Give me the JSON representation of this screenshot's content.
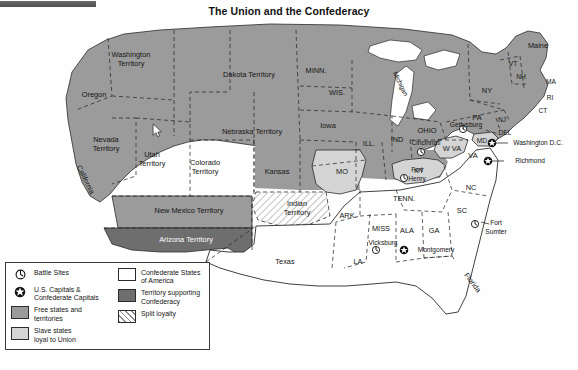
{
  "title": "The Union and the Confederacy",
  "colors": {
    "free_states": "#9b9b9b",
    "slave_loyal": "#d4d4d4",
    "confederate": "#ffffff",
    "territory_supporting": "#6e6e6e",
    "split_loyalty": "#8d8d8d",
    "border": "#2b2b2b",
    "water": "#ffffff",
    "text": "#141414"
  },
  "legend": {
    "left_column": [
      {
        "icon": "battle-site-icon",
        "label": "Battle Sites"
      },
      {
        "icon": "capital-star-icon",
        "label": "U.S. Capitals &\nConfederate Capitals"
      },
      {
        "swatch": "free",
        "label": "Free states and\nterritories"
      },
      {
        "swatch": "slave",
        "label": "Slave states\nloyal to Union"
      }
    ],
    "right_column": [
      {
        "swatch": "csa",
        "label": "Confederate States\nof America"
      },
      {
        "swatch": "terr",
        "label": "Territory supporting\nConfederacy"
      },
      {
        "swatch": "split",
        "label": "Split loyalty"
      }
    ],
    "left_items": [
      "Battle Sites",
      "U.S. Capitals & Confederate Capitals",
      "Free states and territories",
      "Slave states loyal to Union"
    ],
    "right_items": [
      "Confederate States of America",
      "Territory supporting Confederacy",
      "Split loyalty"
    ]
  },
  "regions": [
    {
      "name": "Washington Territory",
      "label": "Washington\nTerritory",
      "category": "free_states",
      "x": 131,
      "y": 60
    },
    {
      "name": "Oregon",
      "label": "Oregon",
      "category": "free_states",
      "x": 94,
      "y": 95
    },
    {
      "name": "Nevada Territory",
      "label": "Nevada\nTerritory",
      "category": "free_states",
      "x": 106,
      "y": 145
    },
    {
      "name": "Utah Territory",
      "label": "Utah\nTerritory",
      "category": "free_states",
      "x": 152,
      "y": 158
    },
    {
      "name": "California",
      "label": "California",
      "category": "free_states",
      "x": 85,
      "y": 180,
      "rotated": true
    },
    {
      "name": "Dakota Territory",
      "label": "Dakota Territory",
      "category": "free_states",
      "x": 249,
      "y": 75
    },
    {
      "name": "Nebraska Territory",
      "label": "Nebraska Territory",
      "category": "free_states",
      "x": 252,
      "y": 132
    },
    {
      "name": "Colorado Territory",
      "label": "Colorado\nTerritory",
      "category": "free_states",
      "x": 205,
      "y": 168
    },
    {
      "name": "Kansas",
      "label": "Kansas",
      "category": "free_states",
      "x": 277,
      "y": 172
    },
    {
      "name": "New Mexico Territory",
      "label": "New Mexico Territory",
      "category": "free_states",
      "x": 189,
      "y": 211
    },
    {
      "name": "Arizona Territory",
      "label": "Arizona Territory",
      "category": "territory_supporting",
      "x": 186,
      "y": 239,
      "white_text": true
    },
    {
      "name": "Minnesota",
      "label": "MINN.",
      "category": "free_states",
      "x": 316,
      "y": 71
    },
    {
      "name": "Wisconsin",
      "label": "WIS.",
      "category": "free_states",
      "x": 337,
      "y": 93
    },
    {
      "name": "Michigan",
      "label": "Michigan",
      "category": "free_states",
      "x": 398,
      "y": 82,
      "rotated": true
    },
    {
      "name": "Iowa",
      "label": "Iowa",
      "category": "free_states",
      "x": 328,
      "y": 126
    },
    {
      "name": "Illinois",
      "label": "ILL.",
      "category": "free_states",
      "x": 369,
      "y": 144
    },
    {
      "name": "Indiana",
      "label": "IND",
      "category": "free_states",
      "x": 397,
      "y": 140
    },
    {
      "name": "Ohio",
      "label": "OHIO",
      "category": "free_states",
      "x": 425,
      "y": 131
    },
    {
      "name": "Missouri",
      "label": "MO",
      "category": "slave_loyal",
      "x": 342,
      "y": 172
    },
    {
      "name": "Kentucky",
      "label": "KY",
      "category": "slave_loyal",
      "x": 419,
      "y": 170
    },
    {
      "name": "West Virginia",
      "label": "W VA",
      "category": "slave_loyal",
      "x": 449,
      "y": 148
    },
    {
      "name": "Maryland",
      "label": "MD",
      "category": "slave_loyal",
      "x": 482,
      "y": 141
    },
    {
      "name": "Delaware",
      "label": "DEL",
      "category": "free_states",
      "x": 502,
      "y": 133
    },
    {
      "name": "Pennsylvania",
      "label": "PA",
      "category": "free_states",
      "x": 477,
      "y": 118
    },
    {
      "name": "New York",
      "label": "NY",
      "category": "free_states",
      "x": 487,
      "y": 91
    },
    {
      "name": "Vermont",
      "label": "VT",
      "category": "free_states",
      "x": 512,
      "y": 64
    },
    {
      "name": "New Hampshire",
      "label": "NH",
      "category": "free_states",
      "x": 521,
      "y": 76
    },
    {
      "name": "Maine",
      "label": "Maine",
      "category": "free_states",
      "x": 538,
      "y": 46
    },
    {
      "name": "Massachusetts",
      "label": "MA",
      "category": "free_states",
      "x": 549,
      "y": 82
    },
    {
      "name": "Rhode Island",
      "label": "RI",
      "category": "free_states",
      "x": 548,
      "y": 98
    },
    {
      "name": "Connecticut",
      "label": "CT",
      "category": "free_states",
      "x": 542,
      "y": 110
    },
    {
      "name": "New Jersey",
      "label": "NJ",
      "category": "free_states",
      "x": 501,
      "y": 120
    },
    {
      "name": "Virginia",
      "label": "VA",
      "category": "confederate",
      "x": 473,
      "y": 156
    },
    {
      "name": "North Carolina",
      "label": "NC",
      "category": "confederate",
      "x": 471,
      "y": 188
    },
    {
      "name": "South Carolina",
      "label": "SC",
      "category": "confederate",
      "x": 462,
      "y": 211
    },
    {
      "name": "Tennessee",
      "label": "TENN.",
      "category": "confederate",
      "x": 404,
      "y": 199
    },
    {
      "name": "Arkansas",
      "label": "ARK.",
      "category": "confederate",
      "x": 348,
      "y": 216
    },
    {
      "name": "Mississippi",
      "label": "MISS",
      "category": "confederate",
      "x": 381,
      "y": 229
    },
    {
      "name": "Alabama",
      "label": "ALA",
      "category": "confederate",
      "x": 407,
      "y": 231
    },
    {
      "name": "Georgia",
      "label": "GA",
      "category": "confederate",
      "x": 434,
      "y": 231
    },
    {
      "name": "Louisiana",
      "label": "LA",
      "category": "confederate",
      "x": 358,
      "y": 262
    },
    {
      "name": "Texas",
      "label": "Texas",
      "category": "confederate",
      "x": 285,
      "y": 262
    },
    {
      "name": "Florida",
      "label": "Florida",
      "category": "confederate",
      "x": 472,
      "y": 283,
      "rotated": true
    },
    {
      "name": "Indian Territory",
      "label": "Indian\nTerritory",
      "category": "split_loyalty",
      "x": 297,
      "y": 208
    }
  ],
  "cities": [
    {
      "name": "Gettysburg",
      "label": "Gettysburg",
      "type": "battle",
      "x": 463,
      "y": 129,
      "label_x": 466,
      "label_y": 126
    },
    {
      "name": "Washington D.C.",
      "label": "Washington D.C.",
      "type": "capital",
      "x": 492,
      "y": 143,
      "label_x": 536,
      "label_y": 143
    },
    {
      "name": "Richmond",
      "label": "Richmond",
      "type": "capital",
      "x": 488,
      "y": 161,
      "label_x": 530,
      "label_y": 161
    },
    {
      "name": "Cincinnati",
      "label": "Cincinnati",
      "type": "battle",
      "x": 421,
      "y": 152,
      "label_x": 423,
      "label_y": 143
    },
    {
      "name": "Fort Henry",
      "label": "Fort\nHenry",
      "type": "battle",
      "x": 404,
      "y": 178,
      "label_x": 417,
      "label_y": 174
    },
    {
      "name": "Fort Sumter",
      "label": "Fort\nSumter",
      "type": "battle",
      "x": 475,
      "y": 224,
      "label_x": 494,
      "label_y": 227
    },
    {
      "name": "Vicksburg",
      "label": "Vicksburg",
      "type": "battle",
      "x": 376,
      "y": 250,
      "label_x": 382,
      "label_y": 243
    },
    {
      "name": "Montgomery",
      "label": "Montgomery",
      "type": "capital",
      "x": 404,
      "y": 250,
      "label_x": 434,
      "label_y": 250
    }
  ],
  "cursor": {
    "x": 156,
    "y": 128
  }
}
